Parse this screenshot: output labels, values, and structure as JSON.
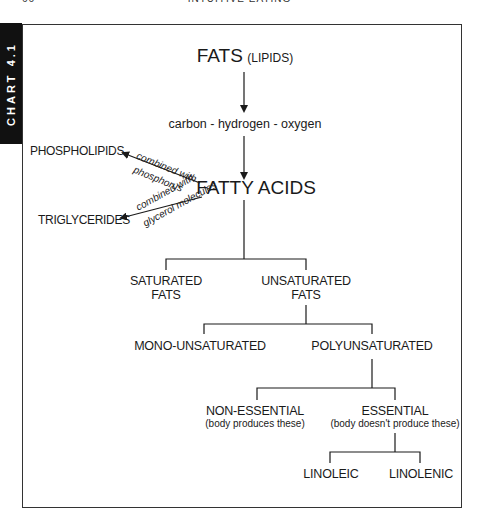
{
  "page_header": {
    "page_number": "66",
    "running_title": "INTUITIVE EATING"
  },
  "side_tab": {
    "label": "CHART 4.1"
  },
  "diagram": {
    "root": {
      "title": "FATS",
      "subtitle": "(LIPIDS)"
    },
    "composition": "carbon - hydrogen - oxygen",
    "fatty_acids": "FATTY ACIDS",
    "branches": {
      "phospholipids": {
        "label": "PHOSPHOLIPIDS",
        "edge_label_1": "combined with",
        "edge_label_2": "phosphorus"
      },
      "triglycerides": {
        "label": "TRIGLYCERIDES",
        "edge_label_1": "combined with",
        "edge_label_2": "glycerol molecules"
      }
    },
    "level2": {
      "saturated": {
        "line1": "SATURATED",
        "line2": "FATS"
      },
      "unsaturated": {
        "line1": "UNSATURATED",
        "line2": "FATS"
      }
    },
    "level3": {
      "mono": "MONO-UNSATURATED",
      "poly": "POLYUNSATURATED"
    },
    "level4": {
      "non_essential": {
        "label": "NON-ESSENTIAL",
        "note": "(body produces these)"
      },
      "essential": {
        "label": "ESSENTIAL",
        "note": "(body doesn't produce these)"
      }
    },
    "level5": {
      "linoleic": "LINOLEIC",
      "linolenic": "LINOLENIC"
    }
  },
  "colors": {
    "ink": "#1a1a1a",
    "tab_bg": "#111111",
    "tab_text": "#ffffff",
    "frame": "#333333"
  }
}
